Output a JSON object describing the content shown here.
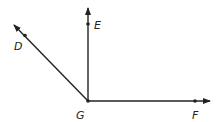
{
  "diagram": {
    "type": "geometry-rays",
    "vertex": {
      "label": "G",
      "x": 88,
      "y": 101
    },
    "rays": [
      {
        "name": "GE",
        "point_label": "E",
        "point": {
          "x": 88,
          "y": 24
        },
        "tip": {
          "x": 88,
          "y": 7
        }
      },
      {
        "name": "GD",
        "point_label": "D",
        "point": {
          "x": 25,
          "y": 35
        },
        "tip": {
          "x": 13,
          "y": 24
        }
      },
      {
        "name": "GF",
        "point_label": "F",
        "point": {
          "x": 195,
          "y": 101
        },
        "tip": {
          "x": 211,
          "y": 101
        }
      }
    ],
    "labels": {
      "E": "E",
      "D": "D",
      "G": "G",
      "F": "F"
    },
    "colors": {
      "stroke": "#222222",
      "background": "#ffffff"
    }
  }
}
